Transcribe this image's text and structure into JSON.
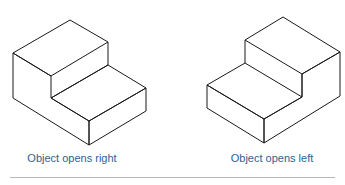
{
  "figures": [
    {
      "id": "left",
      "caption": "Object opens right"
    },
    {
      "id": "right",
      "caption": "Object opens left"
    }
  ],
  "colors": {
    "line": "#1a1a1a",
    "caption": "#2f5f8f",
    "divider": "#b8b8b8"
  }
}
